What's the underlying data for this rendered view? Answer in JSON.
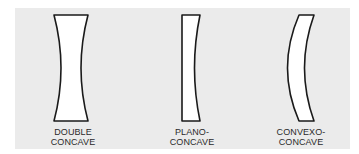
{
  "diagram": {
    "colors": {
      "background_panel": "#ebebeb",
      "page": "#ffffff",
      "lens_fill": "#ffffff",
      "lens_stroke": "#1a1a1a",
      "label_text": "#2a2a2a"
    },
    "lenses": [
      {
        "id": "double-concave",
        "label_line1": "DOUBLE",
        "label_line2": "CONCAVE"
      },
      {
        "id": "plano-concave",
        "label_line1": "PLANO-",
        "label_line2": "CONCAVE"
      },
      {
        "id": "convexo-concave",
        "label_line1": "CONVEXO-",
        "label_line2": "CONCAVE"
      }
    ]
  }
}
